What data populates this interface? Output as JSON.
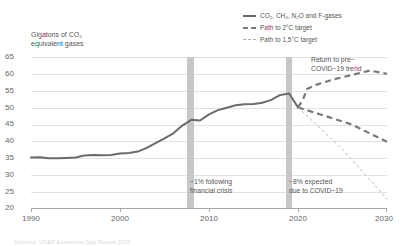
{
  "chart_data": {
    "type": "line",
    "title": "",
    "ylabel": "Gigatons of CO₂ equivalent gases",
    "xlabel": "",
    "xlim": [
      1990,
      2030
    ],
    "ylim": [
      20,
      65
    ],
    "grid": true,
    "legend_position": "top-right",
    "yticks": [
      "65",
      "60",
      "55",
      "50",
      "45",
      "40",
      "35",
      "30",
      "25",
      "20"
    ],
    "ytick_values": [
      65,
      60,
      55,
      50,
      45,
      40,
      35,
      30,
      25,
      20
    ],
    "xticks": [
      "1990",
      "2000",
      "2010",
      "2020",
      "2030"
    ],
    "xtick_values": [
      1990,
      2000,
      2010,
      2020,
      2030
    ],
    "legend": [
      {
        "label": "CO₂, CH₄, N₂O and F-gases",
        "style": "solid",
        "color": "#6b6b6b"
      },
      {
        "label": "Path to 2°C target",
        "style": "dashed",
        "color": "#7a7a7a"
      },
      {
        "label": "Path to 1,5°C target",
        "style": "dashed-thin",
        "color": "#b9b9b9"
      }
    ],
    "series": [
      {
        "name": "CO₂, CH₄, N₂O and F-gases",
        "style": "solid",
        "x": [
          1990,
          1991,
          1992,
          1993,
          1994,
          1995,
          1996,
          1997,
          1998,
          1999,
          2000,
          2001,
          2002,
          2003,
          2004,
          2005,
          2006,
          2007,
          2008,
          2009,
          2010,
          2011,
          2012,
          2013,
          2014,
          2015,
          2016,
          2017,
          2018,
          2019,
          2020
        ],
        "values": [
          33.1,
          33.2,
          32.9,
          32.9,
          33.0,
          33.1,
          33.7,
          33.9,
          33.8,
          33.9,
          34.3,
          34.5,
          34.9,
          36.0,
          37.4,
          38.8,
          40.3,
          42.6,
          44.3,
          44.1,
          45.9,
          47.2,
          47.9,
          48.6,
          48.9,
          49.0,
          49.4,
          50.2,
          51.7,
          52.1,
          48.0
        ]
      },
      {
        "name": "Return to pre-COVID-19 trend",
        "style": "dashed",
        "x": [
          2020,
          2021,
          2022,
          2024,
          2026,
          2028,
          2030
        ],
        "values": [
          48.0,
          53.4,
          54.6,
          56.3,
          57.6,
          58.9,
          60.2
        ]
      },
      {
        "name": "Path to 2°C target",
        "style": "dashed",
        "x": [
          2020,
          2023,
          2026,
          2030
        ],
        "values": [
          48.0,
          45.5,
          43.0,
          39.9
        ]
      },
      {
        "name": "Path to 1,5°C target",
        "style": "dashed-thin",
        "x": [
          2020,
          2025,
          2030
        ],
        "values": [
          48.0,
          35.5,
          23.0
        ]
      }
    ],
    "bands": [
      {
        "name": "financial-crisis-band",
        "x_start": 2007.55,
        "x_end": 2008.35,
        "color": "#c4c4c4"
      },
      {
        "name": "covid-band",
        "x_start": 2018.55,
        "x_end": 2019.3,
        "color": "#c4c4c4"
      }
    ],
    "annotations": [
      {
        "name": "financial-crisis",
        "line1": "−1% following",
        "line2": "financial crisis"
      },
      {
        "name": "covid",
        "line1": "−8% expected",
        "line2": "due to COVID−19"
      },
      {
        "name": "pre-covid-trend",
        "line1": "Return to pre−",
        "line2": "COVID−19 trend"
      }
    ]
  },
  "footnote": "Sources: UNEP Emissions Gap Report 2020"
}
